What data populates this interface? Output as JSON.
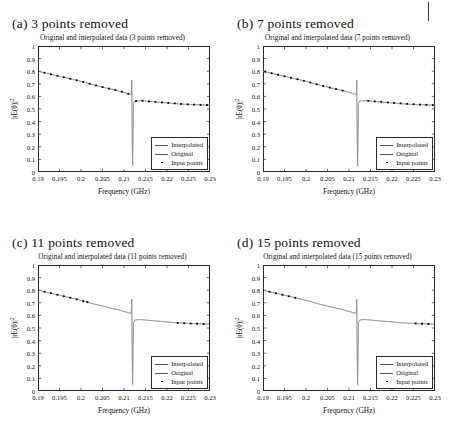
{
  "figure": {
    "xaxis_title": "Frequency (GHz)",
    "yaxis_title": "|rE(θ)|",
    "yaxis_exponent": "2",
    "legend": [
      {
        "label": "Interpolated",
        "key": "line"
      },
      {
        "label": "Original",
        "key": "line"
      },
      {
        "label": "Input points",
        "key": "dot"
      }
    ],
    "xticks": [
      "0.19",
      "0.195",
      "0.2",
      "0.205",
      "0.21",
      "0.215",
      "0.22",
      "0.225",
      "0.23"
    ],
    "yticks": [
      "0",
      "0.1",
      "0.2",
      "0.3",
      "0.4",
      "0.5",
      "0.6",
      "0.7",
      "0.8",
      "0.9",
      "1"
    ],
    "panels": [
      {
        "caption": "(a) 3 points removed",
        "title": "Original and interpolated data (3 points removed)",
        "removed": 3
      },
      {
        "caption": "(b) 7 points removed",
        "title": "Original and interpolated data (7 points removed)",
        "removed": 7
      },
      {
        "caption": "(c) 11 points removed",
        "title": "Original and interpolated data (11 points removed)",
        "removed": 11
      },
      {
        "caption": "(d) 15 points removed",
        "title": "Original and interpolated data (15 points removed)",
        "removed": 15
      }
    ]
  },
  "chart_data": {
    "type": "line",
    "title": "Original and interpolated data",
    "xlabel": "Frequency (GHz)",
    "ylabel": "|rE(theta)|^2",
    "xlim": [
      0.19,
      0.23
    ],
    "ylim": [
      0,
      1
    ],
    "xticks": [
      0.19,
      0.195,
      0.2,
      0.205,
      0.21,
      0.215,
      0.22,
      0.225,
      0.23
    ],
    "yticks": [
      0,
      0.1,
      0.2,
      0.3,
      0.4,
      0.5,
      0.6,
      0.7,
      0.8,
      0.9,
      1.0
    ],
    "grid": false,
    "legend_position": "lower-right",
    "resonance_frequency": 0.2118,
    "series_common": {
      "name": "Original",
      "x": [
        0.19,
        0.191,
        0.192,
        0.193,
        0.194,
        0.195,
        0.196,
        0.197,
        0.198,
        0.199,
        0.2,
        0.201,
        0.202,
        0.203,
        0.204,
        0.205,
        0.206,
        0.207,
        0.208,
        0.209,
        0.21,
        0.2105,
        0.211,
        0.2113,
        0.2115,
        0.2116,
        0.2117,
        0.21175,
        0.2118,
        0.21185,
        0.2119,
        0.212,
        0.2122,
        0.2125,
        0.213,
        0.214,
        0.215,
        0.216,
        0.217,
        0.218,
        0.219,
        0.22,
        0.221,
        0.222,
        0.223,
        0.224,
        0.225,
        0.226,
        0.227,
        0.228,
        0.229,
        0.23
      ],
      "y": [
        0.8,
        0.792,
        0.784,
        0.776,
        0.768,
        0.76,
        0.752,
        0.744,
        0.736,
        0.728,
        0.72,
        0.71,
        0.7,
        0.691,
        0.682,
        0.674,
        0.666,
        0.658,
        0.65,
        0.641,
        0.632,
        0.627,
        0.621,
        0.618,
        0.616,
        0.617,
        0.628,
        0.66,
        0.73,
        0.5,
        0.3,
        0.05,
        0.545,
        0.562,
        0.566,
        0.566,
        0.563,
        0.56,
        0.557,
        0.554,
        0.551,
        0.548,
        0.545,
        0.542,
        0.54,
        0.538,
        0.536,
        0.535,
        0.534,
        0.533,
        0.532,
        0.531
      ]
    },
    "panels": [
      {
        "name": "(a) 3 points removed",
        "removed": 3,
        "input_points_x": [
          0.19,
          0.1915,
          0.193,
          0.1945,
          0.196,
          0.1975,
          0.199,
          0.2005,
          0.202,
          0.2035,
          0.205,
          0.2065,
          0.208,
          0.2095,
          0.211,
          0.2128,
          0.2143,
          0.2158,
          0.2173,
          0.2188,
          0.2203,
          0.2218,
          0.2233,
          0.2248,
          0.2263,
          0.2278,
          0.2293
        ],
        "input_points_y": [
          0.8,
          0.788,
          0.776,
          0.764,
          0.752,
          0.74,
          0.728,
          0.714,
          0.7,
          0.687,
          0.674,
          0.662,
          0.65,
          0.637,
          0.621,
          0.562,
          0.566,
          0.56,
          0.557,
          0.552,
          0.548,
          0.545,
          0.54,
          0.537,
          0.535,
          0.533,
          0.531
        ]
      },
      {
        "name": "(b) 7 points removed",
        "removed": 7,
        "input_points_x": [
          0.1905,
          0.192,
          0.1935,
          0.195,
          0.1965,
          0.198,
          0.1995,
          0.201,
          0.2025,
          0.204,
          0.2055,
          0.207,
          0.2085,
          0.2145,
          0.216,
          0.2175,
          0.219,
          0.2205,
          0.222,
          0.2235,
          0.225,
          0.2265,
          0.228,
          0.2295
        ],
        "input_points_y": [
          0.796,
          0.784,
          0.772,
          0.76,
          0.748,
          0.736,
          0.724,
          0.71,
          0.696,
          0.683,
          0.67,
          0.658,
          0.646,
          0.565,
          0.56,
          0.557,
          0.552,
          0.548,
          0.545,
          0.541,
          0.538,
          0.535,
          0.533,
          0.531
        ]
      },
      {
        "name": "(c) 11 points removed",
        "removed": 11,
        "input_points_x": [
          0.19,
          0.1915,
          0.193,
          0.1945,
          0.196,
          0.1975,
          0.199,
          0.2005,
          0.2015,
          0.2225,
          0.224,
          0.2255,
          0.227,
          0.2285,
          0.23
        ],
        "input_points_y": [
          0.8,
          0.788,
          0.776,
          0.764,
          0.752,
          0.74,
          0.728,
          0.712,
          0.705,
          0.54,
          0.538,
          0.536,
          0.534,
          0.532,
          0.531
        ]
      },
      {
        "name": "(d) 15 points removed",
        "removed": 15,
        "input_points_x": [
          0.19,
          0.1915,
          0.193,
          0.1945,
          0.196,
          0.1975,
          0.2255,
          0.227,
          0.2285,
          0.23
        ],
        "input_points_y": [
          0.8,
          0.788,
          0.776,
          0.764,
          0.752,
          0.74,
          0.536,
          0.534,
          0.532,
          0.531
        ]
      }
    ]
  }
}
